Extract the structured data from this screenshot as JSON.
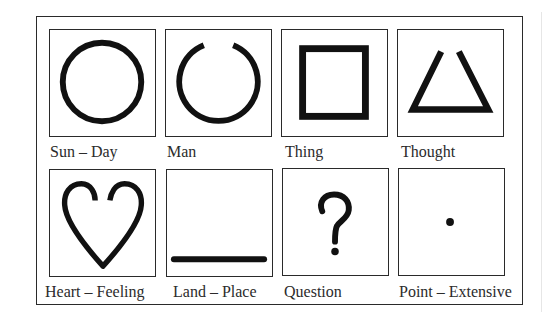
{
  "diagram": {
    "title": "",
    "symbols": [
      {
        "label": "Sun – Day",
        "icon": "circle-icon"
      },
      {
        "label": "Man",
        "icon": "open-circle-icon"
      },
      {
        "label": "Thing",
        "icon": "square-icon"
      },
      {
        "label": "Thought",
        "icon": "open-triangle-icon"
      },
      {
        "label": "Heart – Feeling",
        "icon": "heart-icon"
      },
      {
        "label": "Land – Place",
        "icon": "horizontal-line-icon"
      },
      {
        "label": "Question",
        "icon": "question-mark-icon"
      },
      {
        "label": "Point – Extensive",
        "icon": "dot-icon"
      }
    ],
    "colors": {
      "stroke": "#111111",
      "border": "#2a2a2a",
      "text": "#2b2b2b",
      "background": "#ffffff"
    }
  }
}
